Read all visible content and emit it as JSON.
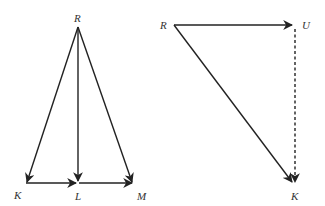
{
  "left_diagram": {
    "labels": {
      "R": "R",
      "K": "K",
      "L": "L",
      "M": "M"
    },
    "vectors": [
      {
        "from": "R",
        "to": "K",
        "style": "solid"
      },
      {
        "from": "R",
        "to": "L",
        "style": "solid"
      },
      {
        "from": "R",
        "to": "M",
        "style": "solid"
      },
      {
        "from": "K",
        "to": "L",
        "style": "solid"
      },
      {
        "from": "L",
        "to": "M",
        "style": "solid"
      }
    ]
  },
  "right_diagram": {
    "labels": {
      "R": "R",
      "U": "U",
      "K": "K"
    },
    "vectors": [
      {
        "from": "R",
        "to": "U",
        "style": "solid"
      },
      {
        "from": "R",
        "to": "K",
        "style": "solid"
      },
      {
        "from": "U",
        "to": "K",
        "style": "dashed"
      }
    ]
  },
  "colors": {
    "line": "#222222",
    "label": "#333333",
    "background": "#ffffff"
  }
}
